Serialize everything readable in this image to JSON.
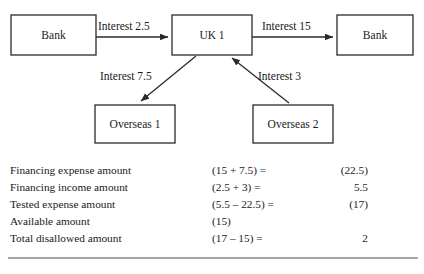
{
  "diagram": {
    "nodes": [
      {
        "id": "bank-left",
        "label": "Bank",
        "x": 11,
        "y": 15,
        "w": 85,
        "h": 40
      },
      {
        "id": "uk-1",
        "label": "UK 1",
        "x": 172,
        "y": 15,
        "w": 80,
        "h": 40
      },
      {
        "id": "bank-right",
        "label": "Bank",
        "x": 337,
        "y": 15,
        "w": 76,
        "h": 40
      },
      {
        "id": "overseas-1",
        "label": "Overseas 1",
        "x": 95,
        "y": 105,
        "w": 80,
        "h": 38
      },
      {
        "id": "overseas-2",
        "label": "Overseas 2",
        "x": 253,
        "y": 105,
        "w": 80,
        "h": 38
      }
    ],
    "edges": [
      {
        "id": "bank-left-to-uk1",
        "label": "Interest 2.5",
        "label_x": 98,
        "label_y": 30,
        "x1": 96,
        "y1": 37,
        "x2": 170,
        "y2": 37
      },
      {
        "id": "uk1-to-bank-right",
        "label": "Interest 15",
        "label_x": 262,
        "label_y": 30,
        "x1": 252,
        "y1": 37,
        "x2": 335,
        "y2": 37
      },
      {
        "id": "uk1-to-overseas1",
        "label": "Interest 7.5",
        "label_x": 100,
        "label_y": 80,
        "x1": 196,
        "y1": 56,
        "x2": 139,
        "y2": 103
      },
      {
        "id": "overseas2-to-uk1",
        "label": "Interest 3",
        "label_x": 258,
        "label_y": 80,
        "x1": 289,
        "y1": 103,
        "x2": 230,
        "y2": 56
      }
    ]
  },
  "table": {
    "columns": [
      "description",
      "calculation",
      "amount"
    ],
    "rows": [
      {
        "description": "Financing expense amount",
        "calculation": "(15 + 7.5) =",
        "amount": "(22.5)"
      },
      {
        "description": "Financing income amount",
        "calculation": "(2.5 + 3) =",
        "amount": "5.5"
      },
      {
        "description": "Tested expense amount",
        "calculation": "(5.5 – 22.5) =",
        "amount": "(17)"
      },
      {
        "description": "Available amount",
        "calculation": "(15)",
        "amount": ""
      },
      {
        "description": "Total disallowed amount",
        "calculation": "(17 – 15) =",
        "amount": "2"
      }
    ],
    "bottom_rule": {
      "x1": 8,
      "x2": 418,
      "y": 258
    }
  }
}
